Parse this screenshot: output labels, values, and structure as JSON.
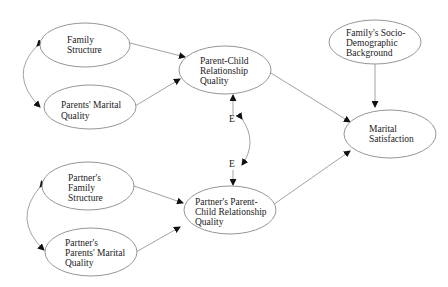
{
  "nodes": {
    "family_structure": {
      "lines": [
        "Family",
        "Structure"
      ]
    },
    "parents_marital_quality": {
      "lines": [
        "Parents' Marital",
        "Quality"
      ]
    },
    "parent_child_quality": {
      "lines": [
        "Parent-Child",
        "Relationship",
        "Quality"
      ]
    },
    "socio_demographic": {
      "lines": [
        "Family's Socio-",
        "Demographic",
        "Background"
      ]
    },
    "marital_satisfaction": {
      "lines": [
        "Marital",
        "Satisfaction"
      ]
    },
    "partner_family_structure": {
      "lines": [
        "Partner's",
        "Family",
        "Structure"
      ]
    },
    "partner_parents_marital_quality": {
      "lines": [
        "Partner's",
        "Parents' Marital",
        "Quality"
      ]
    },
    "partner_parent_child_quality": {
      "lines": [
        "Partner's Parent-",
        "Child Relationship",
        "Quality"
      ]
    }
  },
  "error_terms": {
    "e1": "E",
    "e2": "E"
  }
}
